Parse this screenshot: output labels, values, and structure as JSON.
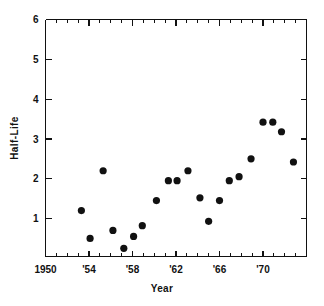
{
  "chart_data": {
    "type": "scatter",
    "title": "",
    "xlabel": "Year",
    "ylabel": "Half-Life",
    "xlim": [
      1950,
      1974
    ],
    "ylim": [
      0,
      6
    ],
    "grid": false,
    "legend": null,
    "x_tick_labels": [
      "1950",
      "'54",
      "'58",
      "'62",
      "'66",
      "'70"
    ],
    "x_tick_values": [
      1950,
      1954,
      1958,
      1962,
      1966,
      1970
    ],
    "x_minor_tick_values": [
      1951,
      1952,
      1953,
      1955,
      1956,
      1957,
      1959,
      1960,
      1961,
      1963,
      1964,
      1965,
      1967,
      1968,
      1969,
      1971,
      1972,
      1973,
      1974
    ],
    "y_tick_labels": [
      "1",
      "2",
      "3",
      "4",
      "5",
      "6"
    ],
    "y_tick_values": [
      1,
      2,
      3,
      4,
      5,
      6
    ],
    "marker": "filled-circle",
    "marker_color": "#111111",
    "marker_size": 6,
    "points": [
      {
        "x": 1953.3,
        "y": 1.2
      },
      {
        "x": 1954.1,
        "y": 0.5
      },
      {
        "x": 1955.3,
        "y": 2.2
      },
      {
        "x": 1956.2,
        "y": 0.7
      },
      {
        "x": 1957.2,
        "y": 0.25
      },
      {
        "x": 1958.1,
        "y": 0.55
      },
      {
        "x": 1958.9,
        "y": 0.82
      },
      {
        "x": 1960.2,
        "y": 1.45
      },
      {
        "x": 1961.3,
        "y": 1.95
      },
      {
        "x": 1962.1,
        "y": 1.95
      },
      {
        "x": 1963.1,
        "y": 2.2
      },
      {
        "x": 1964.2,
        "y": 1.52
      },
      {
        "x": 1965.0,
        "y": 0.93
      },
      {
        "x": 1966.0,
        "y": 1.45
      },
      {
        "x": 1966.9,
        "y": 1.95
      },
      {
        "x": 1967.8,
        "y": 2.05
      },
      {
        "x": 1968.9,
        "y": 2.5
      },
      {
        "x": 1970.0,
        "y": 3.42
      },
      {
        "x": 1970.9,
        "y": 3.42
      },
      {
        "x": 1971.7,
        "y": 3.18
      },
      {
        "x": 1972.8,
        "y": 2.42
      }
    ]
  },
  "figure": {
    "axis_color": "#111111",
    "background": "#ffffff"
  }
}
